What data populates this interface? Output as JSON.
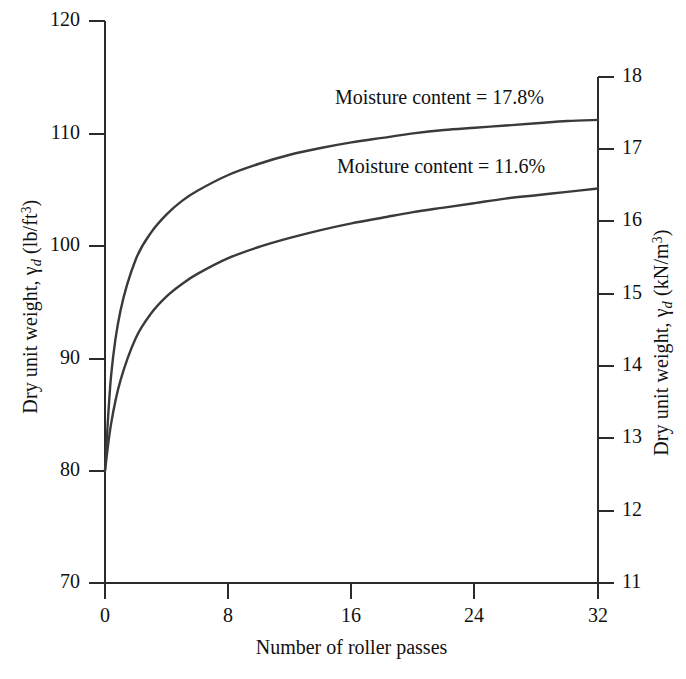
{
  "chart_data": {
    "type": "line",
    "title": "",
    "xlabel": "Number of roller passes",
    "ylabel": "Dry unit weight, γd (lb/ft3)",
    "ylabel_right": "Dry unit weight, γd (kN/m3)",
    "xlim": [
      0,
      32
    ],
    "ylim": [
      70,
      120
    ],
    "ylim_right": [
      11,
      18
    ],
    "xticks": [
      0,
      8,
      16,
      24,
      32
    ],
    "yticks": [
      70,
      80,
      90,
      100,
      110,
      120
    ],
    "yticks_right": [
      11,
      12,
      13,
      14,
      15,
      16,
      17,
      18
    ],
    "grid": false,
    "legend": "none",
    "line_color": "#3a3a3a",
    "series": [
      {
        "name": "Moisture content = 17.8%",
        "annotation": "Moisture content = 17.8%",
        "x": [
          0,
          0.4,
          1,
          2,
          3,
          4,
          5,
          6,
          8,
          10,
          12,
          14,
          16,
          18,
          20,
          22,
          24,
          26,
          28,
          30,
          32
        ],
        "values": [
          80.0,
          88.5,
          94.2,
          98.8,
          101.2,
          102.8,
          104.0,
          104.9,
          106.3,
          107.3,
          108.1,
          108.7,
          109.2,
          109.6,
          110.0,
          110.3,
          110.5,
          110.7,
          110.9,
          111.1,
          111.2
        ]
      },
      {
        "name": "Moisture content = 11.6%",
        "annotation": "Moisture content = 11.6%",
        "x": [
          0,
          0.4,
          1,
          2,
          3,
          4,
          5,
          6,
          8,
          10,
          12,
          14,
          16,
          18,
          20,
          22,
          24,
          26,
          28,
          30,
          32
        ],
        "values": [
          80.0,
          84.2,
          88.0,
          91.8,
          94.0,
          95.5,
          96.6,
          97.5,
          98.9,
          99.9,
          100.7,
          101.4,
          102.0,
          102.5,
          103.0,
          103.4,
          103.8,
          104.2,
          104.5,
          104.8,
          105.1
        ]
      }
    ]
  },
  "axes": {
    "left_title_pre": "Dry unit weight, ",
    "left_title_gamma": "γ",
    "left_title_sub": "d",
    "left_title_unit_open": " (lb/ft",
    "left_title_sup": "3",
    "left_title_close": ")",
    "right_title_pre": "Dry unit weight, ",
    "right_title_gamma": "γ",
    "right_title_sub": "d",
    "right_title_unit_open": " (kN/m",
    "right_title_sup": "3",
    "right_title_close": ")",
    "x_title": "Number of roller passes"
  },
  "ticks": {
    "left": [
      "120",
      "110",
      "100",
      "90",
      "80",
      "70"
    ],
    "right": [
      "18",
      "17",
      "16",
      "15",
      "14",
      "13",
      "12",
      "11"
    ],
    "x": [
      "0",
      "8",
      "16",
      "24",
      "32"
    ]
  },
  "annotations": {
    "upper": "Moisture content = 17.8%",
    "lower": "Moisture content = 11.6%"
  }
}
